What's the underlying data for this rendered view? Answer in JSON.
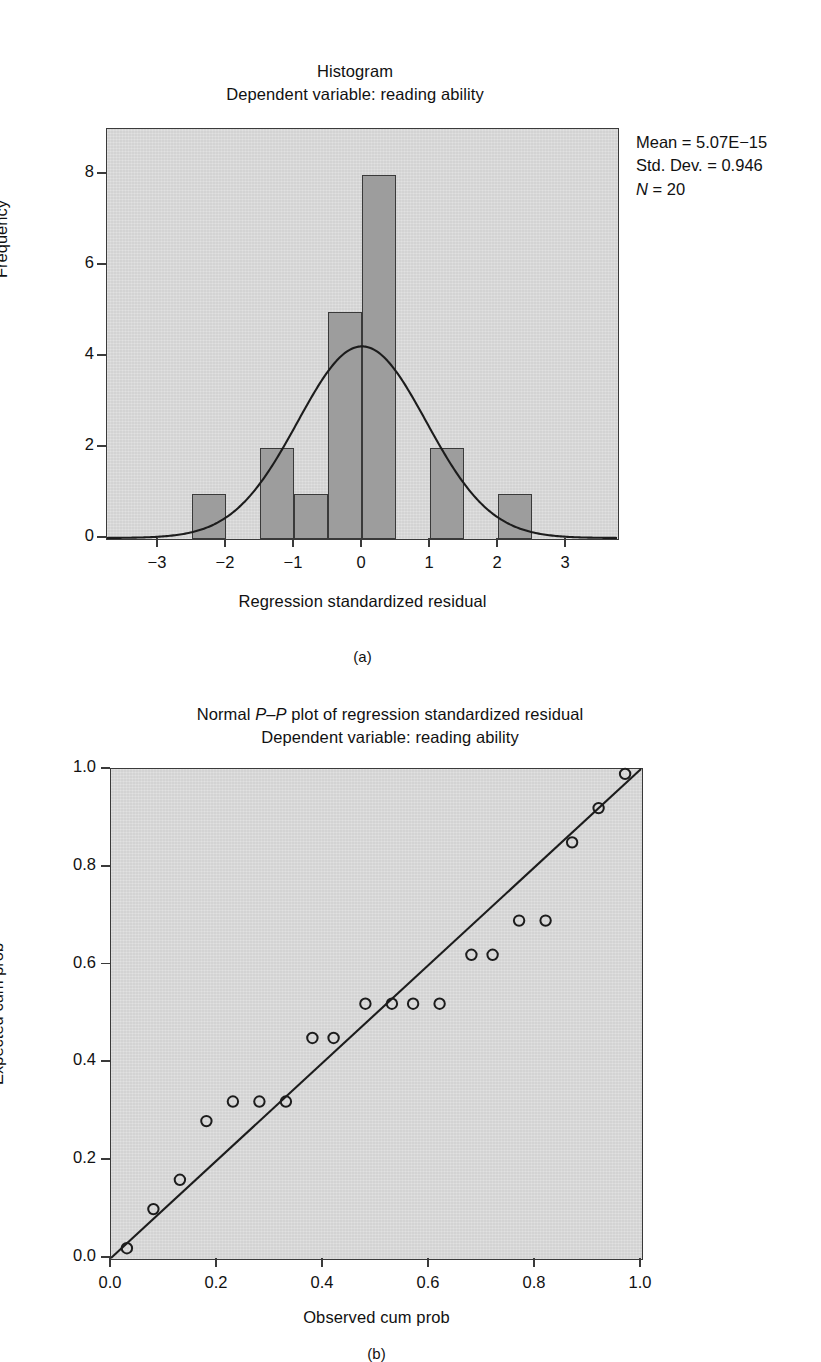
{
  "page": {
    "top_header": "",
    "bottom_caption": ""
  },
  "figure_a": {
    "title_line1": "Histogram",
    "title_line2": "Dependent variable: reading ability",
    "panel_letter": "(a)",
    "stats": {
      "mean_label": "Mean = 5.07E−15",
      "sd_label": "Std. Dev. = 0.946",
      "n_symbol": "N",
      "n_value": " = 20"
    }
  },
  "figure_b": {
    "title_line1_pre": "Normal ",
    "title_line1_ital": "P–P",
    "title_line1_post": " plot of regression standardized residual",
    "title_line2": "Dependent variable: reading ability",
    "panel_letter": "(b)"
  },
  "chart_data": [
    {
      "type": "bar",
      "id": "histogram",
      "title": "Histogram",
      "subtitle": "Dependent variable: reading ability",
      "xlabel": "Regression standardized residual",
      "ylabel": "Frequency",
      "xlim": [
        -3.75,
        3.75
      ],
      "ylim": [
        0,
        9
      ],
      "xticks": [
        "−3",
        "−2",
        "−1",
        "0",
        "1",
        "2",
        "3"
      ],
      "xtick_values": [
        -3,
        -2,
        -1,
        0,
        1,
        2,
        3
      ],
      "yticks": [
        "0",
        "2",
        "4",
        "6",
        "8"
      ],
      "ytick_values": [
        0,
        2,
        4,
        6,
        8
      ],
      "grid": false,
      "bin_width": 0.5,
      "bins": [
        {
          "center": -2.25,
          "left": -2.5,
          "right": -2.0,
          "frequency": 1
        },
        {
          "center": -1.25,
          "left": -1.5,
          "right": -1.0,
          "frequency": 2
        },
        {
          "center": -0.75,
          "left": -1.0,
          "right": -0.5,
          "frequency": 1
        },
        {
          "center": -0.25,
          "left": -0.5,
          "right": 0.0,
          "frequency": 5
        },
        {
          "center": 0.25,
          "left": 0.0,
          "right": 0.5,
          "frequency": 8
        },
        {
          "center": 1.25,
          "left": 1.0,
          "right": 1.5,
          "frequency": 2
        },
        {
          "center": 2.25,
          "left": 2.0,
          "right": 2.5,
          "frequency": 1
        }
      ],
      "normal_curve": {
        "mean": 0.0,
        "std_dev": 0.946,
        "n": 20,
        "peak_frequency": 4.22
      },
      "annotations": [
        "Mean = 5.07E−15",
        "Std. Dev. = 0.946",
        "N = 20"
      ]
    },
    {
      "type": "scatter",
      "id": "pp-plot",
      "title": "Normal P–P plot of regression standardized residual",
      "subtitle": "Dependent variable: reading ability",
      "xlabel": "Observed cum prob",
      "ylabel": "Expected cum prob",
      "xlim": [
        0.0,
        1.0
      ],
      "ylim": [
        0.0,
        1.0
      ],
      "xticks": [
        "0.0",
        "0.2",
        "0.4",
        "0.6",
        "0.8",
        "1.0"
      ],
      "xtick_values": [
        0.0,
        0.2,
        0.4,
        0.6,
        0.8,
        1.0
      ],
      "yticks": [
        "0.0",
        "0.2",
        "0.4",
        "0.6",
        "0.8",
        "1.0"
      ],
      "ytick_values": [
        0.0,
        0.2,
        0.4,
        0.6,
        0.8,
        1.0
      ],
      "grid": false,
      "reference_line": {
        "from": [
          0.0,
          0.0
        ],
        "to": [
          1.0,
          1.0
        ]
      },
      "points": [
        {
          "x": 0.03,
          "y": 0.02
        },
        {
          "x": 0.08,
          "y": 0.1
        },
        {
          "x": 0.13,
          "y": 0.16
        },
        {
          "x": 0.18,
          "y": 0.28
        },
        {
          "x": 0.23,
          "y": 0.32
        },
        {
          "x": 0.28,
          "y": 0.32
        },
        {
          "x": 0.33,
          "y": 0.32
        },
        {
          "x": 0.38,
          "y": 0.45
        },
        {
          "x": 0.42,
          "y": 0.45
        },
        {
          "x": 0.48,
          "y": 0.52
        },
        {
          "x": 0.53,
          "y": 0.52
        },
        {
          "x": 0.57,
          "y": 0.52
        },
        {
          "x": 0.62,
          "y": 0.52
        },
        {
          "x": 0.68,
          "y": 0.62
        },
        {
          "x": 0.72,
          "y": 0.62
        },
        {
          "x": 0.77,
          "y": 0.69
        },
        {
          "x": 0.82,
          "y": 0.69
        },
        {
          "x": 0.87,
          "y": 0.85
        },
        {
          "x": 0.92,
          "y": 0.92
        },
        {
          "x": 0.97,
          "y": 0.99
        }
      ]
    }
  ]
}
